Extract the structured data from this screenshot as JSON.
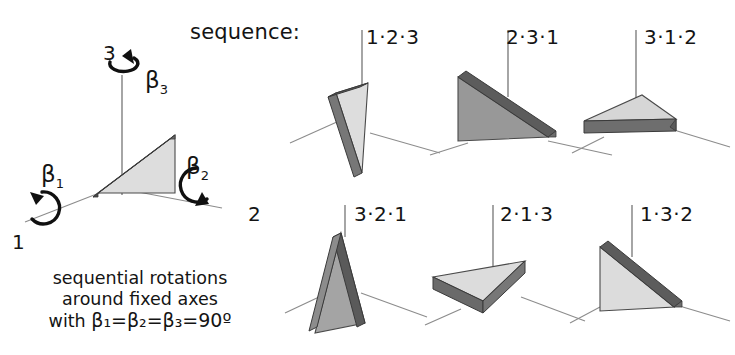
{
  "figure": {
    "title_word": "sequence:",
    "caption_lines": [
      "sequential rotations",
      "around fixed axes"
    ],
    "caption_formula_prefix": "with ",
    "caption_formula": "β₁=β₂=β₃=90º",
    "angle_value": "90",
    "degree_symbol": "º"
  },
  "reference": {
    "axis_labels": {
      "axis1": "1",
      "axis2": "2",
      "axis3": "3"
    },
    "rotation_labels": {
      "beta1": "β",
      "beta1_sub": "1",
      "beta2": "β",
      "beta2_sub": "2",
      "beta3": "β",
      "beta3_sub": "3"
    }
  },
  "panels": [
    {
      "id": "p1",
      "label": "1·2·3",
      "row": "top",
      "col": 1
    },
    {
      "id": "p2",
      "label": "2·3·1",
      "row": "top",
      "col": 2
    },
    {
      "id": "p3",
      "label": "3·1·2",
      "row": "top",
      "col": 3
    },
    {
      "id": "p4",
      "label": "3·2·1",
      "row": "bottom",
      "col": 1
    },
    {
      "id": "p5",
      "label": "2·1·3",
      "row": "bottom",
      "col": 2
    },
    {
      "id": "p6",
      "label": "1·3·2",
      "row": "bottom",
      "col": 3
    }
  ],
  "colors": {
    "background": "#ffffff",
    "ink": "#141414",
    "axis_line": "#8c8c8c",
    "face_light": "#dcdcdc",
    "face_mid": "#b4b4b4",
    "face_dark": "#9a9a9a",
    "bevel_dark": "#4f4f4f",
    "outline": "#3a3a3a"
  }
}
